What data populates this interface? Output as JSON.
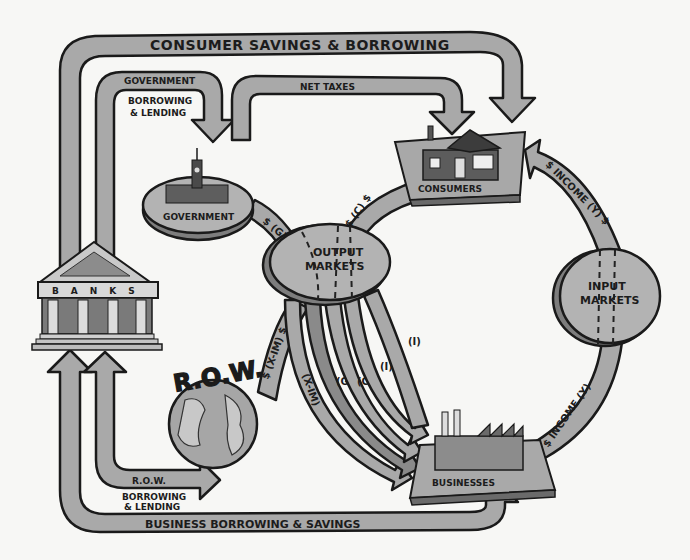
{
  "diagram": {
    "nodes": {
      "banks": {
        "label": "BANKS"
      },
      "government": {
        "label": "GOVERNMENT"
      },
      "consumers": {
        "label": "CONSUMERS"
      },
      "output_markets": {
        "label_line1": "OUTPUT",
        "label_line2": "MARKETS"
      },
      "input_markets": {
        "label_line1": "INPUT",
        "label_line2": "MARKETS"
      },
      "businesses": {
        "label": "BUSINESSES"
      },
      "row": {
        "label": "R.O.W."
      }
    },
    "flows": {
      "consumer_savings": {
        "label": "CONSUMER SAVINGS & BORROWING"
      },
      "net_taxes": {
        "label": "NET TAXES"
      },
      "gov_borrowing": {
        "label_line1": "GOVERNMENT",
        "label_line2": "BORROWING",
        "label_line3": "& LENDING"
      },
      "row_borrowing": {
        "label_line1": "R.O.W.",
        "label_line2": "BORROWING",
        "label_line3": "& LENDING"
      },
      "business_borrowing": {
        "label": "BUSINESS BORROWING & SAVINGS"
      },
      "income_top": {
        "label": "$ INCOME (Y) $"
      },
      "income_bottom": {
        "label": "$ INCOME (Y)"
      },
      "gov_to_output": {
        "label": "$ (G) $"
      },
      "consumers_to_output": {
        "label": "$ (C) $"
      },
      "row_to_output": {
        "label": "$ (X-IM) $"
      },
      "out_xim": {
        "label": "(X-IM)"
      },
      "out_g": {
        "label": "(G)"
      },
      "out_c": {
        "label": "(C)"
      },
      "out_i1": {
        "label": "(I)"
      },
      "out_i2": {
        "label": "(I)"
      },
      "dollar": "$"
    }
  }
}
